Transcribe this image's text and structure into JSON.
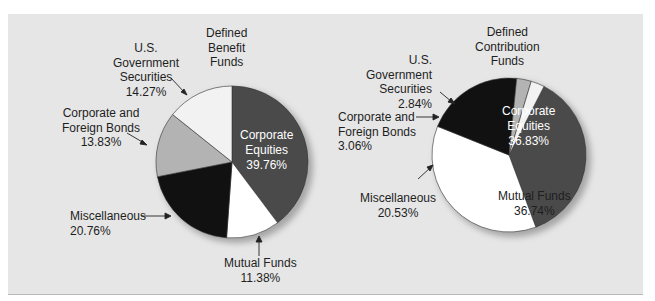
{
  "chart_data": [
    {
      "type": "pie",
      "title": "Defined Benefit Funds",
      "categories": [
        "Corporate Equities",
        "Mutual Funds",
        "Miscellaneous",
        "Corporate and Foreign Bonds",
        "U.S. Government Securities"
      ],
      "values": [
        39.76,
        11.38,
        20.76,
        13.83,
        14.27
      ],
      "unit": "%",
      "colors": [
        "#4a4a4a",
        "#ffffff",
        "#111111",
        "#b3b3b3",
        "#f2f2f2"
      ]
    },
    {
      "type": "pie",
      "title": "Defined Contribution Funds",
      "categories": [
        "Corporate Equities",
        "Mutual Funds",
        "Miscellaneous",
        "Corporate and Foreign Bonds",
        "U.S. Government Securities"
      ],
      "values": [
        36.83,
        36.74,
        20.53,
        3.06,
        2.84
      ],
      "unit": "%",
      "colors": [
        "#4a4a4a",
        "#ffffff",
        "#111111",
        "#b3b3b3",
        "#f2f2f2"
      ]
    }
  ],
  "left": {
    "title": "Defined\nBenefit\nFunds",
    "labels": {
      "gov": "U.S.\nGovernment\nSecurities\n14.27%",
      "bonds": "Corporate and\nForeign Bonds\n13.83%",
      "misc": "Miscellaneous\n20.76%",
      "mutual": "Mutual Funds\n11.38%",
      "equities": "Corporate\nEquities\n39.76%"
    }
  },
  "right": {
    "title": "Defined\nContribution\nFunds",
    "labels": {
      "gov": "U.S.\nGovernment\nSecurities\n2.84%",
      "bonds": "Corporate and\nForeign Bonds\n3.06%",
      "misc": "Miscellaneous\n20.53%",
      "mutual": "Mutual Funds\n36.74%",
      "equities": "Corporate\nEquities\n36.83%"
    }
  }
}
